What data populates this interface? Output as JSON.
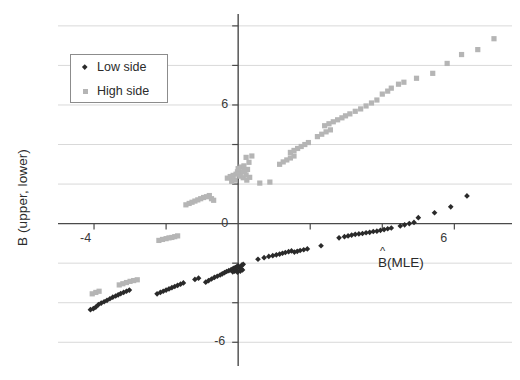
{
  "chart_data": {
    "type": "scatter",
    "title": "",
    "xlabel": "B̂(MLE)",
    "xlabel_base": "B",
    "xlabel_hat": "^",
    "xlabel_suffix": "(MLE)",
    "ylabel": "B (upper, lower)",
    "xlim": [
      -5.0,
      7.6
    ],
    "ylim": [
      -7.2,
      10.6
    ],
    "xticks": [
      -4,
      -2,
      0,
      2,
      4,
      6
    ],
    "xtick_labels": [
      "-4",
      "",
      "0",
      "",
      "",
      "6"
    ],
    "yticks": [
      -6,
      -4,
      -2,
      0,
      2,
      4,
      6,
      8,
      10
    ],
    "ytick_labels": [
      "-6",
      "",
      "",
      "0",
      "",
      "",
      "6",
      "",
      ""
    ],
    "grid": true,
    "grid_axis": "y",
    "grid_color": "#d9d9d9",
    "axis_color": "#4a4a4a",
    "legend_position": "upper left",
    "legend": [
      {
        "name": "Low side",
        "color": "#2a2a2a",
        "marker": "diamond"
      },
      {
        "name": "High side",
        "color": "#b5b5b5",
        "marker": "square"
      }
    ],
    "series": [
      {
        "name": "Low side",
        "color": "#2a2a2a",
        "marker": "diamond",
        "points": [
          [
            -4.1,
            -4.35
          ],
          [
            -4.02,
            -4.3
          ],
          [
            -3.95,
            -4.22
          ],
          [
            -3.88,
            -4.1
          ],
          [
            -3.8,
            -4.02
          ],
          [
            -3.72,
            -3.95
          ],
          [
            -3.64,
            -3.88
          ],
          [
            -3.56,
            -3.8
          ],
          [
            -3.48,
            -3.72
          ],
          [
            -3.4,
            -3.66
          ],
          [
            -3.33,
            -3.6
          ],
          [
            -3.26,
            -3.54
          ],
          [
            -3.18,
            -3.48
          ],
          [
            -3.1,
            -3.42
          ],
          [
            -3.02,
            -3.36
          ],
          [
            -2.25,
            -3.55
          ],
          [
            -2.16,
            -3.48
          ],
          [
            -2.08,
            -3.42
          ],
          [
            -2.0,
            -3.36
          ],
          [
            -1.92,
            -3.3
          ],
          [
            -1.84,
            -3.24
          ],
          [
            -1.76,
            -3.18
          ],
          [
            -1.68,
            -3.12
          ],
          [
            -1.6,
            -3.06
          ],
          [
            -1.52,
            -3.0
          ],
          [
            -1.2,
            -2.82
          ],
          [
            -1.1,
            -2.76
          ],
          [
            -0.9,
            -2.96
          ],
          [
            -0.82,
            -2.88
          ],
          [
            -0.74,
            -2.8
          ],
          [
            -0.66,
            -2.72
          ],
          [
            -0.58,
            -2.66
          ],
          [
            -0.5,
            -2.6
          ],
          [
            -0.44,
            -2.54
          ],
          [
            -0.38,
            -2.48
          ],
          [
            -0.32,
            -2.42
          ],
          [
            -0.26,
            -2.38
          ],
          [
            -0.2,
            -2.34
          ],
          [
            -0.16,
            -2.3
          ],
          [
            -0.12,
            -2.26
          ],
          [
            -0.08,
            -2.22
          ],
          [
            -0.04,
            -2.18
          ],
          [
            0.0,
            -2.14
          ],
          [
            0.04,
            -2.22
          ],
          [
            0.08,
            -2.28
          ],
          [
            -0.05,
            -2.34
          ],
          [
            -0.1,
            -2.4
          ],
          [
            -0.15,
            -2.44
          ],
          [
            0.1,
            -2.1
          ],
          [
            0.14,
            -2.06
          ],
          [
            -0.02,
            -2.46
          ],
          [
            0.06,
            -2.4
          ],
          [
            0.12,
            -2.34
          ],
          [
            0.55,
            -1.8
          ],
          [
            0.72,
            -1.72
          ],
          [
            0.85,
            -1.66
          ],
          [
            0.96,
            -1.62
          ],
          [
            1.06,
            -1.58
          ],
          [
            1.15,
            -1.54
          ],
          [
            1.23,
            -1.5
          ],
          [
            1.31,
            -1.46
          ],
          [
            1.4,
            -1.42
          ],
          [
            1.48,
            -1.38
          ],
          [
            1.56,
            -1.44
          ],
          [
            1.64,
            -1.4
          ],
          [
            1.72,
            -1.36
          ],
          [
            1.82,
            -1.32
          ],
          [
            1.92,
            -1.28
          ],
          [
            2.3,
            -1.12
          ],
          [
            2.8,
            -0.72
          ],
          [
            2.95,
            -0.66
          ],
          [
            3.05,
            -0.62
          ],
          [
            3.15,
            -0.58
          ],
          [
            3.25,
            -0.54
          ],
          [
            3.35,
            -0.52
          ],
          [
            3.45,
            -0.5
          ],
          [
            3.55,
            -0.46
          ],
          [
            3.65,
            -0.44
          ],
          [
            3.75,
            -0.4
          ],
          [
            3.85,
            -0.38
          ],
          [
            3.95,
            -0.34
          ],
          [
            4.05,
            -0.3
          ],
          [
            4.15,
            -0.26
          ],
          [
            4.25,
            -0.22
          ],
          [
            4.5,
            -0.12
          ],
          [
            4.62,
            -0.06
          ],
          [
            4.75,
            0.0
          ],
          [
            4.88,
            0.06
          ],
          [
            5.0,
            0.3
          ],
          [
            5.45,
            0.55
          ],
          [
            5.9,
            0.85
          ],
          [
            6.35,
            1.4
          ]
        ]
      },
      {
        "name": "High side",
        "color": "#b5b5b5",
        "marker": "square",
        "points": [
          [
            -4.05,
            -3.55
          ],
          [
            -3.95,
            -3.48
          ],
          [
            -3.86,
            -3.42
          ],
          [
            -3.3,
            -3.1
          ],
          [
            -3.2,
            -3.04
          ],
          [
            -3.1,
            -2.98
          ],
          [
            -3.0,
            -2.92
          ],
          [
            -2.9,
            -2.88
          ],
          [
            -2.8,
            -2.84
          ],
          [
            -2.2,
            -0.85
          ],
          [
            -2.1,
            -0.8
          ],
          [
            -2.0,
            -0.76
          ],
          [
            -1.92,
            -0.72
          ],
          [
            -1.84,
            -0.7
          ],
          [
            -1.76,
            -0.66
          ],
          [
            -1.68,
            -0.62
          ],
          [
            -1.45,
            0.95
          ],
          [
            -1.36,
            1.02
          ],
          [
            -1.28,
            1.08
          ],
          [
            -1.2,
            1.14
          ],
          [
            -1.12,
            1.2
          ],
          [
            -1.04,
            1.26
          ],
          [
            -0.96,
            1.32
          ],
          [
            -0.88,
            1.36
          ],
          [
            -0.8,
            1.42
          ],
          [
            -0.74,
            1.26
          ],
          [
            -0.68,
            1.18
          ],
          [
            -0.3,
            2.3
          ],
          [
            -0.22,
            2.38
          ],
          [
            -0.14,
            2.44
          ],
          [
            -0.06,
            2.5
          ],
          [
            0.02,
            2.56
          ],
          [
            0.1,
            2.62
          ],
          [
            0.18,
            2.68
          ],
          [
            0.26,
            2.74
          ],
          [
            0.06,
            2.4
          ],
          [
            0.14,
            2.32
          ],
          [
            0.22,
            2.46
          ],
          [
            -0.02,
            2.62
          ],
          [
            0.0,
            2.78
          ],
          [
            0.08,
            2.86
          ],
          [
            0.16,
            2.92
          ],
          [
            -0.1,
            2.2
          ],
          [
            -0.18,
            2.14
          ],
          [
            0.24,
            2.2
          ],
          [
            0.32,
            2.34
          ],
          [
            0.3,
            3.1
          ],
          [
            0.22,
            3.35
          ],
          [
            0.38,
            3.42
          ],
          [
            0.6,
            2.05
          ],
          [
            0.88,
            2.1
          ],
          [
            1.15,
            3.0
          ],
          [
            1.25,
            3.12
          ],
          [
            1.35,
            3.22
          ],
          [
            1.45,
            3.32
          ],
          [
            1.55,
            3.42
          ],
          [
            1.45,
            3.6
          ],
          [
            1.55,
            3.7
          ],
          [
            1.65,
            3.8
          ],
          [
            1.75,
            3.9
          ],
          [
            1.85,
            4.0
          ],
          [
            1.95,
            4.1
          ],
          [
            2.2,
            4.4
          ],
          [
            2.32,
            4.52
          ],
          [
            2.44,
            4.64
          ],
          [
            2.56,
            4.74
          ],
          [
            2.4,
            4.95
          ],
          [
            2.52,
            5.05
          ],
          [
            2.64,
            5.15
          ],
          [
            2.76,
            5.25
          ],
          [
            2.88,
            5.35
          ],
          [
            2.98,
            5.45
          ],
          [
            3.1,
            5.55
          ],
          [
            3.25,
            5.68
          ],
          [
            3.4,
            5.8
          ],
          [
            3.55,
            5.95
          ],
          [
            3.7,
            6.1
          ],
          [
            3.85,
            6.25
          ],
          [
            4.0,
            6.55
          ],
          [
            4.15,
            6.7
          ],
          [
            4.25,
            6.85
          ],
          [
            4.45,
            7.05
          ],
          [
            4.6,
            7.15
          ],
          [
            4.95,
            7.35
          ],
          [
            5.4,
            7.6
          ],
          [
            5.8,
            8.1
          ],
          [
            6.2,
            8.55
          ],
          [
            6.65,
            8.8
          ],
          [
            7.1,
            9.35
          ]
        ]
      }
    ]
  }
}
